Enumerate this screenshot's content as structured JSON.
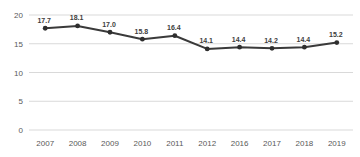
{
  "chart_data": {
    "type": "line",
    "title": "",
    "xlabel": "",
    "ylabel": "",
    "categories": [
      "2007",
      "2008",
      "2009",
      "2010",
      "2011",
      "2012",
      "2016",
      "2017",
      "2018",
      "2019"
    ],
    "series": [
      {
        "name": "",
        "values": [
          17.7,
          18.1,
          17.0,
          15.8,
          16.4,
          14.1,
          14.4,
          14.2,
          14.4,
          15.2
        ],
        "data_labels": [
          "17.7",
          "18.1",
          "17.0",
          "15.8",
          "16.4",
          "14.1",
          "14.4",
          "14.2",
          "14.4",
          "15.2"
        ]
      }
    ],
    "ylim": [
      0,
      20
    ],
    "yticks": [
      0,
      5,
      10,
      15,
      20
    ],
    "grid": true,
    "legend_position": "none",
    "colors": {
      "line": "#3a3a3a",
      "marker": "#2e2e2e",
      "gridline": "#d9d9d9",
      "axis_text": "#595959",
      "data_label_text": "#3d3d3d",
      "background": "#ffffff"
    }
  }
}
